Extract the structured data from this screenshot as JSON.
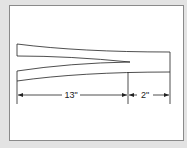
{
  "diagram": {
    "type": "tapered splice / split strip dimension drawing",
    "dimensions": [
      {
        "label": "13\"",
        "description": "length of tapered split section"
      },
      {
        "label": "2\"",
        "description": "length of solid end section"
      }
    ],
    "colors": {
      "background": "#e3e3e3",
      "frame": "#ffffff",
      "line": "#222222"
    }
  }
}
